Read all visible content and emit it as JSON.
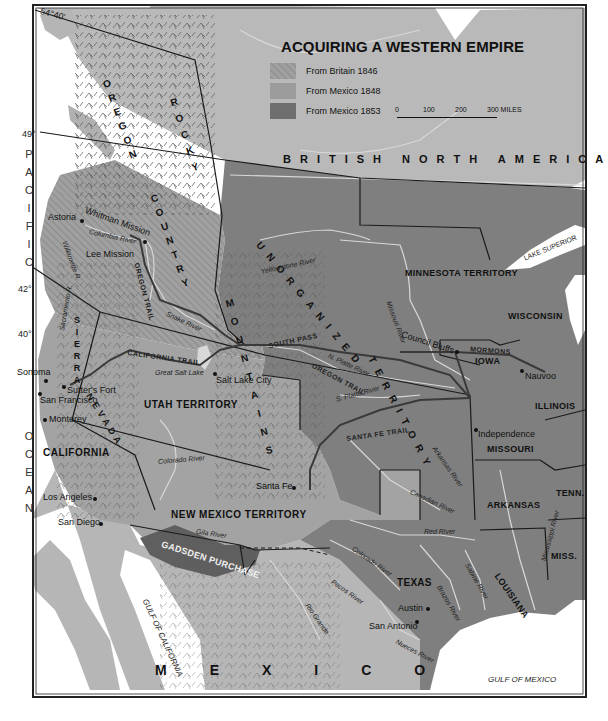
{
  "title": "ACQUIRING A WESTERN EMPIRE",
  "legend": {
    "items": [
      {
        "label": "From Britain 1846",
        "pattern": "hatched",
        "color": "#9a9a9a"
      },
      {
        "label": "From Mexico 1848",
        "pattern": "solid",
        "color": "#9c9c9c"
      },
      {
        "label": "From Mexico 1853",
        "pattern": "solid",
        "color": "#6e6e6e"
      }
    ],
    "scale": {
      "ticks": [
        "0",
        "100",
        "200",
        "300 MILES"
      ]
    }
  },
  "colors": {
    "water": "#ffffff",
    "british_north_america": "#b8b8b8",
    "oregon_country": "#9a9a9a",
    "mexican_cession": "#a3a3a3",
    "united_states": "#7d7d7d",
    "gadsden_purchase": "#5f5f5f",
    "mexico": "#b5b5b5",
    "border": "#1a1a1a"
  },
  "latitudes": [
    "54°40'",
    "49°",
    "42°",
    "40°"
  ],
  "regions": {
    "british_north_america": "BRITISH NORTH AMERICA",
    "oregon": "OREGON",
    "country": "COUNTRY",
    "rocky": "ROCKY",
    "mountains": "MOUNTAINS",
    "unorganized": "UNORGANIZED",
    "territory": "TERRITORY",
    "minnesota": "MINNESOTA TERRITORY",
    "wisconsin": "WISCONSIN",
    "iowa": "IOWA",
    "illinois": "ILLINOIS",
    "missouri": "MISSOURI",
    "tenn": "TENN.",
    "arkansas": "ARKANSAS",
    "miss": "MISS.",
    "louisiana": "LOUISIANA",
    "texas": "TEXAS",
    "utah": "UTAH TERRITORY",
    "new_mexico": "NEW MEXICO TERRITORY",
    "california": "CALIFORNIA",
    "sierra": "SIERRA",
    "nevada": "NEVADA",
    "gadsden": "GADSDEN PURCHASE",
    "mexico": "MEXICO"
  },
  "water_labels": {
    "pacific": "PACIFIC",
    "ocean": "OCEAN",
    "gulf_california": "GULF OF CALIFORNIA",
    "gulf_mexico": "GULF OF MEXICO",
    "lake_superior": "LAKE SUPERIOR"
  },
  "cities": {
    "astoria": "Astoria",
    "whitman": "Whitman Mission",
    "lee": "Lee Mission",
    "sonoma": "Sonoma",
    "sutters": "Sutter's Fort",
    "san_francisco": "San Francisco",
    "monterey": "Monterey",
    "los_angeles": "Los Angeles",
    "san_diego": "San Diego",
    "salt_lake_city": "Salt Lake City",
    "santa_fe": "Santa Fe",
    "council_bluffs": "Council Bluffs",
    "nauvoo": "Nauvoo",
    "independence": "Independence",
    "austin": "Austin",
    "san_antonio": "San Antonio"
  },
  "rivers": {
    "columbia": "Columbia River",
    "willamette": "Willamette R.",
    "snake": "Snake River",
    "sacramento": "Sacramento R.",
    "great_salt_lake": "Great Salt Lake",
    "colorado_w": "Colorado River",
    "gila": "Gila River",
    "yellowstone": "Yellowstone River",
    "missouri": "Missouri River",
    "n_platte": "N. Platte River",
    "s_platte": "S. Platte River",
    "arkansas": "Arkansas River",
    "canadian": "Canadian River",
    "red": "Red River",
    "colorado_tx": "Colorado River",
    "pecos": "Pecos River",
    "rio_grande": "Rio Grande",
    "brazos": "Brazos River",
    "sabine": "Sabine River",
    "nueces": "Nueces River",
    "mississippi": "Mississippi River"
  },
  "trails": {
    "oregon": "OREGON TRAIL",
    "oregon2": "OREGON TRAIL",
    "california": "CALIFORNIA TRAIL",
    "santa_fe": "SANTA FE TRAIL",
    "mormons": "MORMONS",
    "south_pass": "SOUTH PASS"
  }
}
